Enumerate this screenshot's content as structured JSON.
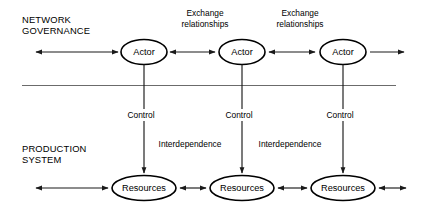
{
  "diagram": {
    "colors": {
      "background": "#ffffff",
      "stroke": "#000000",
      "connector": "#1a1a1a",
      "divider": "#5a5a5a",
      "text": "#000000"
    },
    "sections": [
      {
        "id": "network-governance",
        "line1": "NETWORK",
        "line2": "GOVERNANCE"
      },
      {
        "id": "production-system",
        "line1": "PRODUCTION",
        "line2": "SYSTEM"
      }
    ],
    "actors": [
      {
        "id": "actor-1",
        "label": "Actor"
      },
      {
        "id": "actor-2",
        "label": "Actor"
      },
      {
        "id": "actor-3",
        "label": "Actor"
      }
    ],
    "resources": [
      {
        "id": "resources-1",
        "label": "Resources"
      },
      {
        "id": "resources-2",
        "label": "Resources"
      },
      {
        "id": "resources-3",
        "label": "Resources"
      }
    ],
    "exchange_labels": [
      {
        "id": "exchange-1",
        "line1": "Exchange",
        "line2": "relationships"
      },
      {
        "id": "exchange-2",
        "line1": "Exchange",
        "line2": "relationships"
      }
    ],
    "control_labels": [
      {
        "id": "control-1",
        "label": "Control"
      },
      {
        "id": "control-2",
        "label": "Control"
      },
      {
        "id": "control-3",
        "label": "Control"
      }
    ],
    "interdependence_labels": [
      {
        "id": "interdependence-1",
        "label": "Interdependence"
      },
      {
        "id": "interdependence-2",
        "label": "Interdependence"
      }
    ]
  }
}
